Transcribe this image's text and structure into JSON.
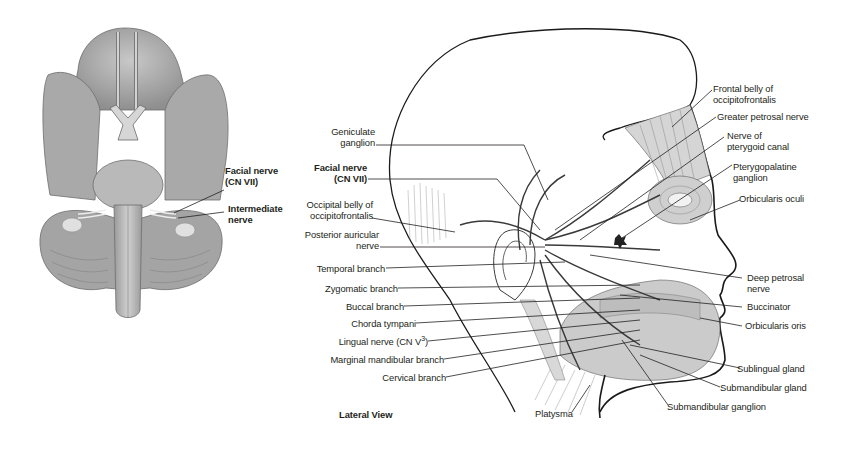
{
  "figure": {
    "left_panel": {
      "name": "inferior-view-brain",
      "labels": [
        {
          "id": "facial_nerve",
          "line1": "Facial nerve",
          "line2": "(CN VII)",
          "bold": true
        },
        {
          "id": "intermediate_nerve",
          "line1": "Intermediate",
          "line2": "nerve",
          "bold": true
        }
      ]
    },
    "right_panel": {
      "name": "lateral-view-head",
      "caption": "Lateral View",
      "left_labels": [
        {
          "id": "geniculate",
          "line1": "Geniculate",
          "line2": "ganglion"
        },
        {
          "id": "facial_nerve",
          "line1": "Facial nerve",
          "line2": "(CN VII)",
          "bold": true
        },
        {
          "id": "occipital_belly",
          "line1": "Occipital belly of",
          "line2": "occipitofrontalis"
        },
        {
          "id": "posterior_auricular",
          "line1": "Posterior auricular",
          "line2": "nerve"
        },
        {
          "id": "temporal",
          "line1": "Temporal branch"
        },
        {
          "id": "zygomatic",
          "line1": "Zygomatic branch"
        },
        {
          "id": "buccal",
          "line1": "Buccal branch"
        },
        {
          "id": "chorda_tympani",
          "line1": "Chorda tympani"
        },
        {
          "id": "lingual",
          "line1": "Lingual nerve (CN V",
          "sup": "3",
          "tail": ")"
        },
        {
          "id": "marginal_mandibular",
          "line1": "Marginal mandibular branch"
        },
        {
          "id": "cervical",
          "line1": "Cervical branch"
        }
      ],
      "right_labels": [
        {
          "id": "frontal_belly",
          "line1": "Frontal belly of",
          "line2": "occipitofrontalis"
        },
        {
          "id": "greater_petrosal",
          "line1": "Greater petrosal nerve"
        },
        {
          "id": "pterygoid_canal",
          "line1": "Nerve of",
          "line2": "pterygoid canal"
        },
        {
          "id": "pterygopalatine",
          "line1": "Pterygopalatine",
          "line2": "ganglion"
        },
        {
          "id": "orbicularis_oculi",
          "line1": "Orbicularis oculi"
        },
        {
          "id": "deep_petrosal",
          "line1": "Deep petrosal",
          "line2": "nerve"
        },
        {
          "id": "buccinator",
          "line1": "Buccinator"
        },
        {
          "id": "orbicularis_oris",
          "line1": "Orbicularis oris"
        },
        {
          "id": "sublingual",
          "line1": "Sublingual gland"
        },
        {
          "id": "submandibular_gland",
          "line1": "Submandibular gland"
        }
      ],
      "bottom_labels": [
        {
          "id": "platysma",
          "line1": "Platysma"
        },
        {
          "id": "submandibular_ganglion",
          "line1": "Submandibular ganglion"
        }
      ]
    }
  },
  "colors": {
    "background": "#ffffff",
    "text": "#231f20",
    "outline": "#1a1a1a",
    "brain_fill": "#b8b8b8",
    "brain_shade": "#8e8e8e",
    "muscle_fill": "#c9c9c9",
    "nerve": "#3a3a3a"
  }
}
